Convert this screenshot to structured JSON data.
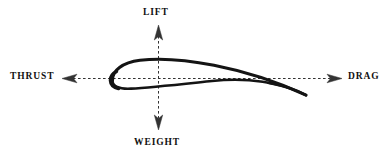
{
  "diagram": {
    "type": "force-vector-diagram",
    "background_color": "#ffffff",
    "stroke_color": "#111111",
    "axis_color": "#333333",
    "labels": {
      "lift": "LIFT",
      "weight": "WEIGHT",
      "thrust": "THRUST",
      "drag": "DRAG"
    },
    "axes": {
      "vertical": {
        "x": 158,
        "top_y": 25,
        "bottom_y": 130,
        "style": "dashed",
        "arrow_top": "LIFT",
        "arrow_bottom": "WEIGHT"
      },
      "horizontal": {
        "y": 78,
        "left_x": 62,
        "right_x": 342,
        "style": "dashed",
        "arrow_left": "THRUST",
        "arrow_right": "DRAG"
      }
    },
    "airfoil": {
      "leading_edge_x": 112,
      "leading_edge_y": 79,
      "trailing_edge_x": 306,
      "trailing_edge_y": 95,
      "max_thickness_y_upper": 60,
      "max_thickness_y_lower": 88,
      "chord_length": 194,
      "description": "cambered airfoil cross-section at positive angle of attack"
    }
  }
}
